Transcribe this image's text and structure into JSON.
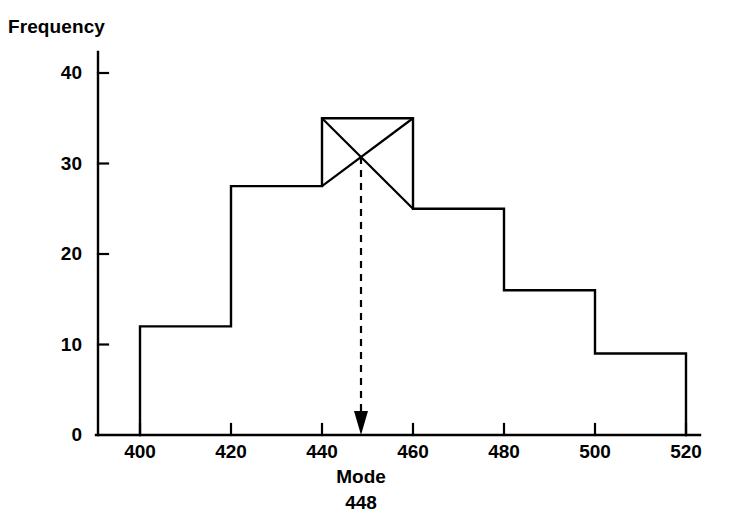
{
  "chart_data": {
    "type": "bar",
    "title": "",
    "subtitle": "",
    "xlabel": "",
    "ylabel": "Frequency",
    "grid": false,
    "legend": false,
    "legend_position": "none",
    "bin_edges": [
      400,
      420,
      440,
      460,
      480,
      500,
      520
    ],
    "categories": [
      "400-420",
      "420-440",
      "440-460",
      "460-480",
      "480-500",
      "500-520"
    ],
    "values": [
      12,
      27.5,
      35,
      25,
      16,
      9
    ],
    "xlim": [
      390,
      530
    ],
    "ylim": [
      0,
      42
    ],
    "x_ticks": [
      400,
      420,
      440,
      460,
      480,
      500,
      520
    ],
    "x_tick_labels": [
      "400",
      "420",
      "440",
      "460",
      "480",
      "500",
      "520"
    ],
    "y_ticks": [
      0,
      10,
      20,
      30,
      40
    ],
    "y_tick_labels": [
      "0",
      "10",
      "20",
      "30",
      "40"
    ],
    "annotations": [
      {
        "name": "mode",
        "label": "Mode",
        "value": "448",
        "x": 448,
        "kind": "dashed-arrow-from-modal-crossing",
        "modal_bin_index": 2
      }
    ],
    "construction_lines": {
      "description": "Cross lines inside the modal bar used to locate the mode graphically",
      "bin_index": 2,
      "line_a": {
        "from": [
          440,
          35
        ],
        "to": [
          460,
          25
        ]
      },
      "line_b": {
        "from": [
          460,
          35
        ],
        "to": [
          440,
          27.5
        ]
      }
    },
    "colors": {
      "line": "#000000",
      "fill": "#ffffff",
      "background": "#ffffff",
      "text": "#000000"
    }
  },
  "labels": {
    "y_axis_title": "Frequency",
    "mode_label": "Mode",
    "mode_value": "448"
  }
}
